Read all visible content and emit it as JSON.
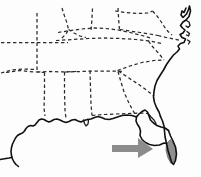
{
  "figure": {
    "kind": "outline-map",
    "region": "Southeastern United States",
    "width": 201,
    "height": 177,
    "background_color": "#fdfdfd"
  },
  "styles": {
    "coastline_color": "#111111",
    "state_border_color": "#2a2a2a",
    "state_border_dash": "3.4 2.6",
    "arrow_color": "#8c8c8c",
    "highlight_fill": "#8f8f8f",
    "highlight_stroke": "#5e5e5e"
  },
  "annotations": {
    "arrow": {
      "name": "pointer-arrow",
      "direction": "right",
      "color": "#8c8c8c",
      "points": "112,145 138,145 138,138 153,149 138,158 138,152 112,152",
      "target": "southern-florida-peninsula"
    },
    "highlight": {
      "name": "highlighted-region",
      "label": "southern Florida tip",
      "color": "#8f8f8f",
      "path": "M 170.5 139.5 L 175.5 146.5 L 176.5 154.5 L 174.5 161.5 L 171.0 163.5 L 168.0 158.0 L 166.0 150.5 L 166.5 143.5 Z"
    }
  },
  "geography": {
    "coastlines": [
      {
        "name": "atlantic-coastline",
        "path": "M 186.0 8.0 L 184.0 12.5 L 182.0 11.0 L 181.0 15.0 L 183.0 17.5 L 186.5 14.0 L 188.5 9.5 L 189.5 6.0 L 190.5 11.0 L 189.0 16.5 L 186.0 20.0 L 183.0 22.0 L 180.5 25.5 L 182.5 28.0 L 185.0 30.0 L 183.0 33.0 L 180.0 34.5 L 182.0 37.5 L 185.5 39.0 L 184.0 42.5 L 180.5 43.5 L 178.0 46.0 L 179.5 49.0 L 177.0 52.0 L 173.5 55.0 L 170.0 59.5 L 166.5 64.5 L 163.5 70.0 L 160.0 75.5 L 157.0 80.5 L 155.0 86.0 L 154.0 91.5 L 153.5 97.0 L 154.5 102.5 L 156.5 107.5 L 159.0 112.0 L 160.5 116.5"
      },
      {
        "name": "delmarva-inlets",
        "path": "M 186.5 20.5 L 189.0 22.0 L 190.0 25.5 L 188.0 27.5 L 186.0 26.0 M 187.0 31.5 L 189.5 33.5 L 188.5 36.0 L 186.5 35.0 M 187.5 40.0 L 190.0 41.5 L 188.5 44.0"
      },
      {
        "name": "florida-east-coast",
        "path": "M 160.5 116.5 L 162.5 121.0 L 164.0 126.0 L 164.5 131.0 L 165.0 136.5 L 166.5 143.5 L 168.0 150.5 L 170.0 157.0 L 171.5 162.0 L 173.5 164.5 L 175.5 160.5 L 176.5 154.0 L 175.5 147.0 L 173.0 141.0 L 170.5 136.0 L 168.5 130.5"
      },
      {
        "name": "florida-gulf-coast",
        "path": "M 168.5 130.5 L 165.0 128.0 L 161.0 127.0 L 157.0 125.5 L 153.5 123.0 L 150.5 120.0 L 149.0 116.0 L 147.5 112.0 L 145.0 110.0 L 142.0 111.5 L 139.0 114.0 L 136.5 117.0 L 136.0 121.0 L 137.5 124.5 L 139.5 127.5 L 140.5 131.0 L 140.0 135.5 L 142.0 139.5 L 145.5 142.5 L 149.5 144.5 L 154.5 145.5 L 159.5 145.0 L 164.0 143.0 L 166.5 143.5"
      },
      {
        "name": "florida-panhandle-coast",
        "path": "M 136.5 117.0 L 132.0 115.5 L 127.0 115.0 L 122.0 115.5 L 117.5 117.0 L 113.0 118.5 L 109.0 119.5 L 105.0 119.0 L 101.5 117.5 L 98.0 116.5 L 94.5 117.5 L 91.0 119.0 L 87.5 119.5"
      },
      {
        "name": "gulf-coast-louisiana",
        "path": "M 87.5 119.5 L 84.0 120.5 L 81.0 122.0 L 78.0 121.0 L 75.0 119.5 L 72.0 120.0 L 69.0 121.5 L 66.0 122.5 L 63.0 121.5 L 60.0 120.0 L 57.0 119.0 L 54.0 119.5 L 51.5 121.0 L 49.0 122.0 L 46.5 121.0 L 44.0 119.5 L 41.5 119.0 L 39.0 120.0 L 37.0 122.5 L 35.0 125.0 L 33.0 126.0 L 30.5 125.5 L 28.0 126.5 L 26.0 128.5 L 24.5 131.0 L 22.5 133.0 L 20.0 134.0 L 17.5 135.5 L 15.5 138.0 L 14.0 141.0 L 12.5 144.0 L 11.5 147.5 L 11.0 151.5 L 11.5 155.5 L 12.5 159.0 L 14.0 162.0 L 16.0 164.5 L 18.5 166.5"
      },
      {
        "name": "texas-coast-stub",
        "path": "M 0 159.5 L 3.0 159.0 L 6.0 158.5 L 9.0 158.0 L 11.3 157.5"
      },
      {
        "name": "mobile-bay-inlet",
        "path": "M 83.5 120.0 L 84.5 123.5 L 86.0 126.0 L 88.0 124.0 L 88.5 120.5"
      },
      {
        "name": "florida-bend-inlet",
        "path": "M 148.0 113.5 L 151.0 117.0 L 154.0 120.0 L 156.0 123.5"
      }
    ],
    "state_borders": [
      {
        "name": "border-north-arkansas",
        "path": "M 1.0 42.5 L 68.0 42.5"
      },
      {
        "name": "border-arkansas-west",
        "path": "M 37.0 13.0 L 37.0 42.5"
      },
      {
        "name": "border-arkansas-east",
        "path": "M 37.0 42.5 L 37.0 72.0"
      },
      {
        "name": "border-arkansas-south",
        "path": "M 6.0 72.5 L 20.0 70.5 L 28.5 71.5 L 37.0 72.0 L 44.5 72.5"
      },
      {
        "name": "border-louisiana-east",
        "path": "M 44.5 72.5 L 44.5 92.5 L 44.0 108.0 L 45.0 116.0"
      },
      {
        "name": "border-mississippi-east",
        "path": "M 64.5 72.0 L 64.5 92.0 L 65.0 110.0 L 66.0 118.5"
      },
      {
        "name": "border-mississippi-north",
        "path": "M 37.0 72.0 L 50.0 71.5 L 64.5 72.0 L 76.0 71.5"
      },
      {
        "name": "border-tennessee-south",
        "path": "M 64.5 72.0 L 80.0 71.5 L 96.0 71.0 L 112.0 71.0 L 124.0 71.5"
      },
      {
        "name": "border-alabama-east",
        "path": "M 90.0 70.5 L 90.5 88.0 L 91.0 104.0 L 92.0 115.5"
      },
      {
        "name": "border-florida-panhandle-north",
        "path": "M 92.0 115.5 L 104.0 114.5 L 116.0 114.0 L 128.0 113.5 L 140.0 113.0 L 148.0 113.5"
      },
      {
        "name": "border-georgia-east",
        "path": "M 118.0 71.5 L 121.0 82.0 L 124.0 92.0 L 128.0 101.0 L 132.0 109.0 L 136.5 116.5"
      },
      {
        "name": "border-georgia-south-carolina",
        "path": "M 118.5 71.0 L 128.0 77.5 L 138.0 84.0 L 147.0 90.5 L 154.0 96.0"
      },
      {
        "name": "border-south-carolina-north",
        "path": "M 117.5 70.5 L 130.0 66.0 L 142.0 62.5 L 154.0 60.5 L 164.0 60.0"
      },
      {
        "name": "border-tennessee-north",
        "path": "M 56.0 40.5 L 72.0 39.5 L 88.0 38.5 L 104.0 38.0 L 120.0 38.5 L 136.0 39.5 L 150.0 41.0 L 162.0 43.5"
      },
      {
        "name": "border-tennessee-virginia-corner",
        "path": "M 148.5 41.0 L 152.0 46.0 L 156.5 51.0 L 160.5 55.5 L 164.0 60.0"
      },
      {
        "name": "border-kentucky-north",
        "path": "M 58.0 32.5 L 70.0 30.5 L 82.0 29.0 L 94.0 28.0 L 106.0 28.5 L 118.0 30.0 L 130.0 32.5 L 142.0 35.5 L 152.0 38.5"
      },
      {
        "name": "border-missouri-illinois",
        "path": "M 62.0 8.0 L 64.5 16.0 L 67.0 23.0 L 68.5 29.5 L 66.0 34.0 L 62.0 38.0"
      },
      {
        "name": "border-illinois-indiana",
        "path": "M 92.5 8.5 L 92.0 17.0 L 91.5 25.0 L 91.0 30.0"
      },
      {
        "name": "border-indiana-ohio",
        "path": "M 118.0 8.0 L 118.5 16.5 L 119.0 24.0 L 119.5 30.0"
      },
      {
        "name": "border-ohio-west-virginia",
        "path": "M 120.0 29.5 L 130.0 31.0 L 140.0 32.5 L 150.0 34.0 L 158.0 35.5"
      },
      {
        "name": "border-west-virginia-east",
        "path": "M 152.5 11.0 L 157.0 16.0 L 161.0 21.5 L 164.5 27.0 L 168.0 31.5 L 172.0 35.0"
      },
      {
        "name": "border-virginia-north",
        "path": "M 158.0 35.5 L 166.0 37.5 L 174.0 39.0 L 180.0 40.5"
      },
      {
        "name": "border-ohio-north",
        "path": "M 115.0 11.0 L 126.0 12.5 L 137.0 13.5 L 148.0 13.0 L 152.5 11.0"
      },
      {
        "name": "border-missouri-north",
        "path": "M 1.0 73.0 L 12.0 70.0 L 24.0 69.0 L 36.0 69.5"
      },
      {
        "name": "border-kentucky-west",
        "path": "M 68.5 29.5 L 74.0 33.0 L 80.0 36.0 L 86.0 37.5"
      }
    ]
  }
}
